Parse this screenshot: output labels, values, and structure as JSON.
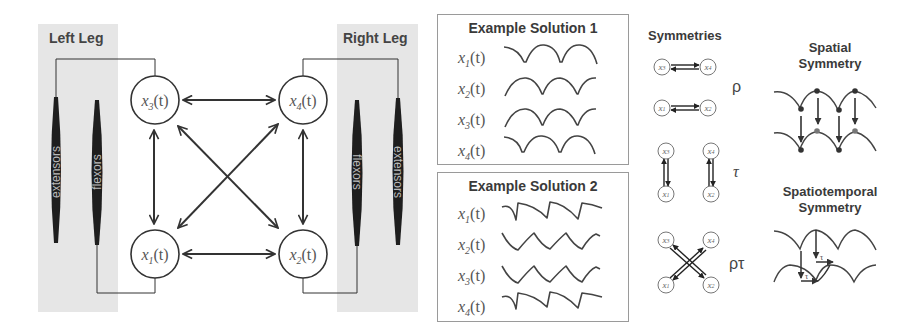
{
  "left_panel": {
    "left_leg": {
      "title": "Left Leg",
      "muscles": [
        {
          "label": "extensors"
        },
        {
          "label": "flexors"
        }
      ]
    },
    "right_leg": {
      "title": "Right Leg",
      "muscles": [
        {
          "label": "flexors"
        },
        {
          "label": "extensors"
        }
      ]
    },
    "nodes": [
      {
        "id": "x3",
        "var": "x",
        "sub": "3",
        "arg": "(t)"
      },
      {
        "id": "x4",
        "var": "x",
        "sub": "4",
        "arg": "(t)"
      },
      {
        "id": "x1",
        "var": "x",
        "sub": "1",
        "arg": "(t)"
      },
      {
        "id": "x2",
        "var": "x",
        "sub": "2",
        "arg": "(t)"
      }
    ]
  },
  "solutions": [
    {
      "title": "Example Solution 1",
      "rows": [
        {
          "var": "x",
          "sub": "1",
          "arg": "(t)"
        },
        {
          "var": "x",
          "sub": "2",
          "arg": "(t)"
        },
        {
          "var": "x",
          "sub": "3",
          "arg": "(t)"
        },
        {
          "var": "x",
          "sub": "4",
          "arg": "(t)"
        }
      ]
    },
    {
      "title": "Example Solution 2",
      "rows": [
        {
          "var": "x",
          "sub": "1",
          "arg": "(t)"
        },
        {
          "var": "x",
          "sub": "2",
          "arg": "(t)"
        },
        {
          "var": "x",
          "sub": "3",
          "arg": "(t)"
        },
        {
          "var": "x",
          "sub": "4",
          "arg": "(t)"
        }
      ]
    }
  ],
  "symmetries": {
    "title": "Symmetries",
    "rho": "ρ",
    "tau": "τ",
    "rho_tau": "ρτ",
    "node_labels": {
      "x1": "1",
      "x2": "2",
      "x3": "3",
      "x4": "4",
      "var": "x"
    }
  },
  "spatial": {
    "title_line1": "Spatial",
    "title_line2": "Symmetry"
  },
  "spatiotemporal": {
    "title_line1": "Spatiotemporal",
    "title_line2": "Symmetry",
    "tau_label": "τ"
  },
  "colors": {
    "panel_grey": "#e6e6e6",
    "line": "#333333",
    "muscle": "#1e1e1e",
    "box_border": "#9a9a9a"
  }
}
